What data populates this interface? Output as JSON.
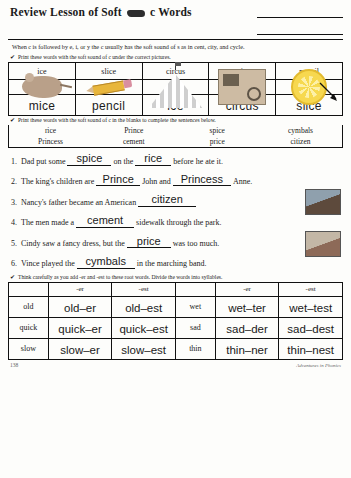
{
  "header": {
    "title_pre": "Review Lesson of Soft",
    "title_post": "c Words",
    "name_lines": [
      "",
      ""
    ]
  },
  "intro": "When c is followed by e, i, or y the c usually has the soft sound of s as in cent, city, and cycle.",
  "directions": {
    "one": "Print these words with the soft sound of c under the correct pictures.",
    "two": "Print these words with the soft sound of c in the blanks to complete the sentences below.",
    "three": "Think carefully as you add -er and -est to these root words. Divide the words into syllables.",
    "check": "✔"
  },
  "picture_table": {
    "words": [
      "ice",
      "slice",
      "circus",
      "mice",
      "pencil"
    ],
    "pictures": [
      "mouse-picture",
      "pencil-picture",
      "circus-tent-picture",
      "carriage-picture",
      "lemon-slice-picture"
    ],
    "answers": [
      "mice",
      "pencil",
      "ice",
      "circus",
      "slice"
    ]
  },
  "word_bank": {
    "row1": [
      "rice",
      "Prince",
      "spice",
      "cymbals"
    ],
    "row2": [
      "Princess",
      "cement",
      "price",
      "citizen"
    ]
  },
  "sentences": [
    {
      "num": "1.",
      "pre": "Dad put some",
      "ans1": "spice",
      "mid": "on the",
      "ans2": "rice",
      "post": "before he ate it.",
      "photo": false
    },
    {
      "num": "2.",
      "pre": "The king's children are",
      "ans1": "Prince",
      "mid": "John and",
      "ans2": "Princess",
      "post": "Anne.",
      "photo": false
    },
    {
      "num": "3.",
      "pre": "Nancy's father became an American",
      "ans1": "citizen",
      "mid": "",
      "ans2": "",
      "post": "",
      "photo": true
    },
    {
      "num": "4.",
      "pre": "The men made a",
      "ans1": "cement",
      "mid": "",
      "ans2": "",
      "post": "sidewalk through the park.",
      "photo": false
    },
    {
      "num": "5.",
      "pre": "Cindy saw a fancy dress, but the",
      "ans1": "price",
      "mid": "",
      "ans2": "",
      "post": "was too much.",
      "photo": true
    },
    {
      "num": "6.",
      "pre": "Vince played the",
      "ans1": "cymbals",
      "mid": "",
      "ans2": "",
      "post": "in the marching band.",
      "photo": false
    }
  ],
  "suffix_table": {
    "headers": [
      "",
      "-er",
      "-est",
      "",
      "-er",
      "-est"
    ],
    "rows": [
      {
        "base_left": "old",
        "er_left": "old–er",
        "est_left": "old–est",
        "base_right": "wet",
        "er_right": "wet–ter",
        "est_right": "wet–test"
      },
      {
        "base_left": "quick",
        "er_left": "quick–er",
        "est_left": "quick–est",
        "base_right": "sad",
        "er_right": "sad–der",
        "est_right": "sad–dest"
      },
      {
        "base_left": "slow",
        "er_left": "slow–er",
        "est_left": "slow–est",
        "base_right": "thin",
        "er_right": "thin–ner",
        "est_right": "thin–nest"
      }
    ]
  },
  "footer": {
    "page": "138",
    "brand": "Adventures in Phonics"
  }
}
